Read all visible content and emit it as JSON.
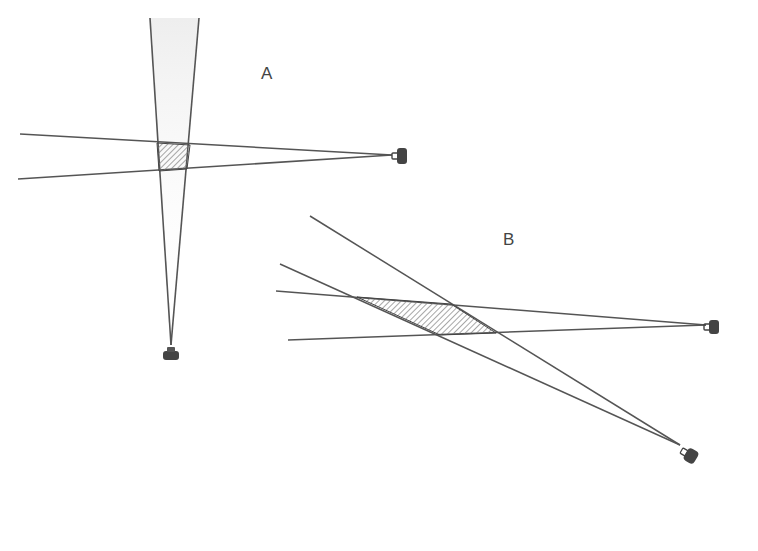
{
  "diagram": {
    "labels": {
      "a": "A",
      "b": "B"
    },
    "colors": {
      "line": "#555555",
      "hatch": "#777777",
      "camera": "#444444",
      "shade": "#e8e8e8"
    },
    "panels": [
      {
        "id": "A",
        "description": "Two cameras at right angles; small square overlap region"
      },
      {
        "id": "B",
        "description": "Two cameras at shallow angle; elongated overlap region"
      }
    ]
  }
}
